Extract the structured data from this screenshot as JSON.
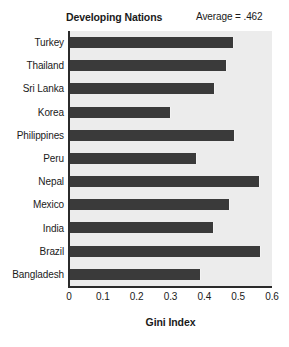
{
  "chart_data": {
    "type": "bar",
    "orientation": "horizontal",
    "title": "Developing Nations",
    "annotation": "Average = .462",
    "xlabel": "Gini Index",
    "ylabel": "",
    "xlim": [
      0,
      0.6
    ],
    "xticks": [
      "0",
      "0.1",
      "0.2",
      "0.3",
      "0.4",
      "0.5",
      "0.6"
    ],
    "xtick_values": [
      0,
      0.1,
      0.2,
      0.3,
      0.4,
      0.5,
      0.6
    ],
    "grid": false,
    "legend": null,
    "categories": [
      "Turkey",
      "Thailand",
      "Sri Lanka",
      "Korea",
      "Philippines",
      "Peru",
      "Nepal",
      "Mexico",
      "India",
      "Brazil",
      "Bangladesh"
    ],
    "values": [
      0.487,
      0.466,
      0.433,
      0.3,
      0.492,
      0.379,
      0.564,
      0.475,
      0.43,
      0.567,
      0.39
    ],
    "bar_color": "#3a3a3a",
    "plot_background": "#ececec",
    "axis_color": "#2b2b2b"
  }
}
